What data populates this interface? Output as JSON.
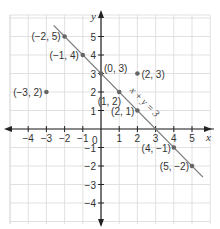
{
  "chart_data": {
    "type": "scatter",
    "title": "",
    "xlabel": "x",
    "ylabel": "y",
    "xlim": [
      -5,
      6
    ],
    "ylim": [
      -5,
      6
    ],
    "grid": true,
    "x_ticks": [
      -4,
      -3,
      -2,
      -1,
      1,
      2,
      3,
      4,
      5
    ],
    "y_ticks": [
      5,
      4,
      3,
      2,
      1,
      -1,
      -2,
      -3,
      -4
    ],
    "origin_label": "0",
    "points": [
      {
        "x": -2,
        "y": 5,
        "label": "(−2, 5)",
        "on_line": true
      },
      {
        "x": -1,
        "y": 4,
        "label": "(−1, 4)",
        "on_line": true
      },
      {
        "x": 0,
        "y": 3,
        "label": "(0, 3)",
        "on_line": true
      },
      {
        "x": 1,
        "y": 2,
        "label": "(1, 2)",
        "on_line": true
      },
      {
        "x": 2,
        "y": 1,
        "label": "(2, 1)",
        "on_line": true
      },
      {
        "x": 4,
        "y": -1,
        "label": "(4, −1)",
        "on_line": true
      },
      {
        "x": 5,
        "y": -2,
        "label": "(5, −2)",
        "on_line": true
      },
      {
        "x": -3,
        "y": 2,
        "label": "(−3, 2)",
        "on_line": false
      },
      {
        "x": 2,
        "y": 3,
        "label": "(2, 3)",
        "on_line": false
      }
    ],
    "lines": [
      {
        "equation": "x + y = 3",
        "label": "x + y = 3",
        "from": [
          -2.6,
          5.6
        ],
        "to": [
          5.6,
          -2.6
        ]
      }
    ],
    "colors": {
      "grid": "#d9d9d9",
      "axis": "#222222",
      "line": "#7a7a7a",
      "point": "#666666"
    }
  }
}
